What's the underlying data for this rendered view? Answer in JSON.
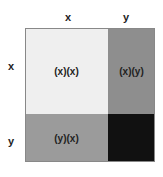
{
  "columns": [
    {
      "label": "x"
    },
    {
      "label": "y"
    }
  ],
  "rows": [
    {
      "label": "x"
    },
    {
      "label": "y"
    }
  ],
  "cells": [
    {
      "label": "(x)(x)",
      "color": "#efefef"
    },
    {
      "label": "(x)(y)",
      "color": "#8e8e8e"
    },
    {
      "label": "(y)(x)",
      "color": "#9b9b9b"
    },
    {
      "label": "",
      "color": "#111111"
    }
  ]
}
